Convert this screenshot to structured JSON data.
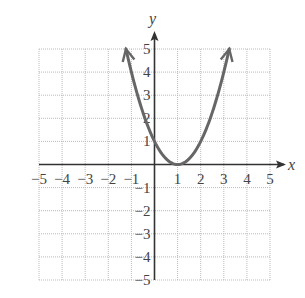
{
  "chart_data": {
    "type": "line",
    "title": "",
    "function": "y = (x - 1)^2",
    "xlabel": "x",
    "ylabel": "y",
    "xlim": [
      -5,
      5
    ],
    "ylim": [
      -5,
      5
    ],
    "grid": true,
    "grid_style": "dotted",
    "x_ticks": [
      -5,
      -4,
      -3,
      -2,
      -1,
      1,
      2,
      3,
      4,
      5
    ],
    "y_ticks": [
      -5,
      -4,
      -3,
      -2,
      -1,
      1,
      2,
      3,
      4,
      5
    ],
    "series": [
      {
        "name": "parabola",
        "color": "#666666",
        "arrows_at_ends": true,
        "x": [
          -1.236,
          -1,
          0,
          1,
          2,
          3,
          3.236
        ],
        "y": [
          5,
          4,
          1,
          0,
          1,
          4,
          5
        ]
      }
    ],
    "key_points": {
      "vertex": [
        1,
        0
      ],
      "y_intercept": [
        0,
        1
      ]
    }
  },
  "colors": {
    "axis": "#333333",
    "grid": "#bbbbbb",
    "curve": "#666666",
    "text": "#444444"
  }
}
